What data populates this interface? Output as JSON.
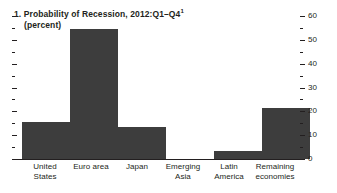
{
  "chart_data": {
    "type": "bar",
    "title": "1. Probability of Recession, 2012:Q1–Q4",
    "title_footnote_marker": "1",
    "subtitle": "(percent)",
    "xlabel": "",
    "ylabel": "",
    "categories": [
      "United States",
      "Euro area",
      "Japan",
      "Emerging Asia",
      "Latin America",
      "Remaining economies"
    ],
    "values": [
      15.5,
      54.5,
      13.5,
      0,
      3.5,
      21.5
    ],
    "ylim": [
      0,
      60
    ],
    "y_axis_position": "right",
    "y_ticks_major": [
      0,
      10,
      20,
      30,
      40,
      50,
      60
    ],
    "y_ticks_major_labels": [
      "0",
      "10",
      "20",
      "30",
      "40",
      "50",
      "60"
    ],
    "y_ticks_minor": [
      5,
      15,
      25,
      35,
      45,
      55
    ],
    "grid": false,
    "legend": null,
    "bar_color": "#3d3d3d",
    "axis_color": "#231f20",
    "background_color": "#ffffff"
  }
}
